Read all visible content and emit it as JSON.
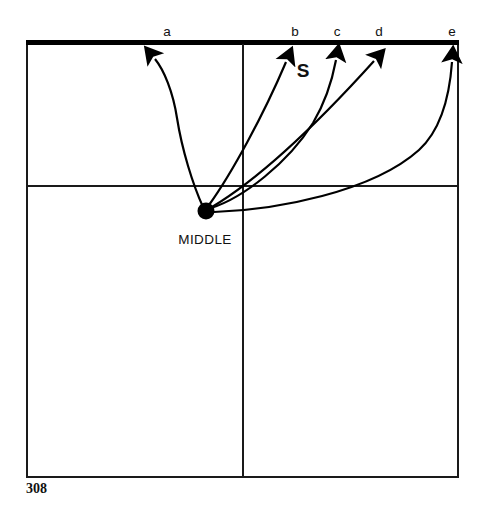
{
  "figure": {
    "kind": "badminton-court-shot-diagram",
    "page_number": "308",
    "center_label": "MIDDLE",
    "serve_label": "S",
    "shot_labels": [
      {
        "id": "a",
        "label": "a",
        "x": 167,
        "y": 34
      },
      {
        "id": "b",
        "label": "b",
        "x": 295,
        "y": 34
      },
      {
        "id": "c",
        "label": "c",
        "x": 337,
        "y": 34
      },
      {
        "id": "d",
        "label": "d",
        "x": 379,
        "y": 34
      },
      {
        "id": "e",
        "label": "e",
        "x": 452,
        "y": 34
      }
    ],
    "center_point": {
      "x": 206,
      "y": 211,
      "radius": 8
    },
    "serve_marker": {
      "x": 303,
      "y": 70
    },
    "court": {
      "left": 26,
      "right": 459,
      "top": 42,
      "bottom": 478,
      "center_line_x": 243,
      "service_line_y": 186,
      "top_line_width": 5,
      "line_color": "#1a1a1a",
      "thick_line_color": "#000000"
    },
    "arrows": [
      {
        "id": "a",
        "tip_x": 152,
        "tip_y": 52,
        "style": "curved-left"
      },
      {
        "id": "b",
        "tip_x": 291,
        "tip_y": 52,
        "style": "straight"
      },
      {
        "id": "c",
        "tip_x": 337,
        "tip_y": 52,
        "style": "curved-right"
      },
      {
        "id": "d",
        "tip_x": 381,
        "tip_y": 51,
        "style": "straight-diagonal"
      },
      {
        "id": "e",
        "tip_x": 452,
        "tip_y": 52,
        "style": "wide-curve-right"
      }
    ]
  }
}
